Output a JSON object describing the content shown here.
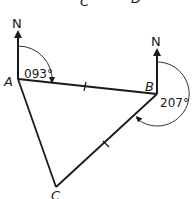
{
  "diagram": {
    "type": "bearings-triangle",
    "top_cut_labels": [
      "C",
      "D"
    ],
    "points": {
      "A": {
        "label": "A"
      },
      "B": {
        "label": "B"
      },
      "C": {
        "label": "C"
      }
    },
    "north_label": "N",
    "bearings": [
      {
        "from": "A",
        "label": "093°"
      },
      {
        "from": "B",
        "label": "207°"
      }
    ],
    "equal_side_ticks": [
      "AB",
      "BC"
    ],
    "colors": {
      "line": "#1a1a1a",
      "arc": "#333333",
      "background": "#ffffff"
    }
  }
}
